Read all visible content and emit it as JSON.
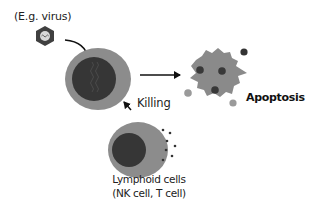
{
  "labels": {
    "virus": "(E.g. virus)",
    "killing": "Killing",
    "apoptosis": "Apoptosis",
    "lymphoid_line1": "Lymphoid cells",
    "lymphoid_line2": "(NK cell, T cell)"
  },
  "icons": {
    "virus": "hexagon-virus-icon",
    "infected_cell": "infected-cell",
    "apoptotic_cell": "apoptotic-cell",
    "lymphoid_cell": "lymphoid-cell"
  },
  "colors": {
    "cell_cytoplasm": "#8c8c8c",
    "cell_nucleus": "#3a3a3a",
    "apoptotic_body": "#8a8a8a",
    "fragments": "#3a3a3a",
    "arrow": "#111111",
    "virus_hex": "#3f3f3f"
  }
}
